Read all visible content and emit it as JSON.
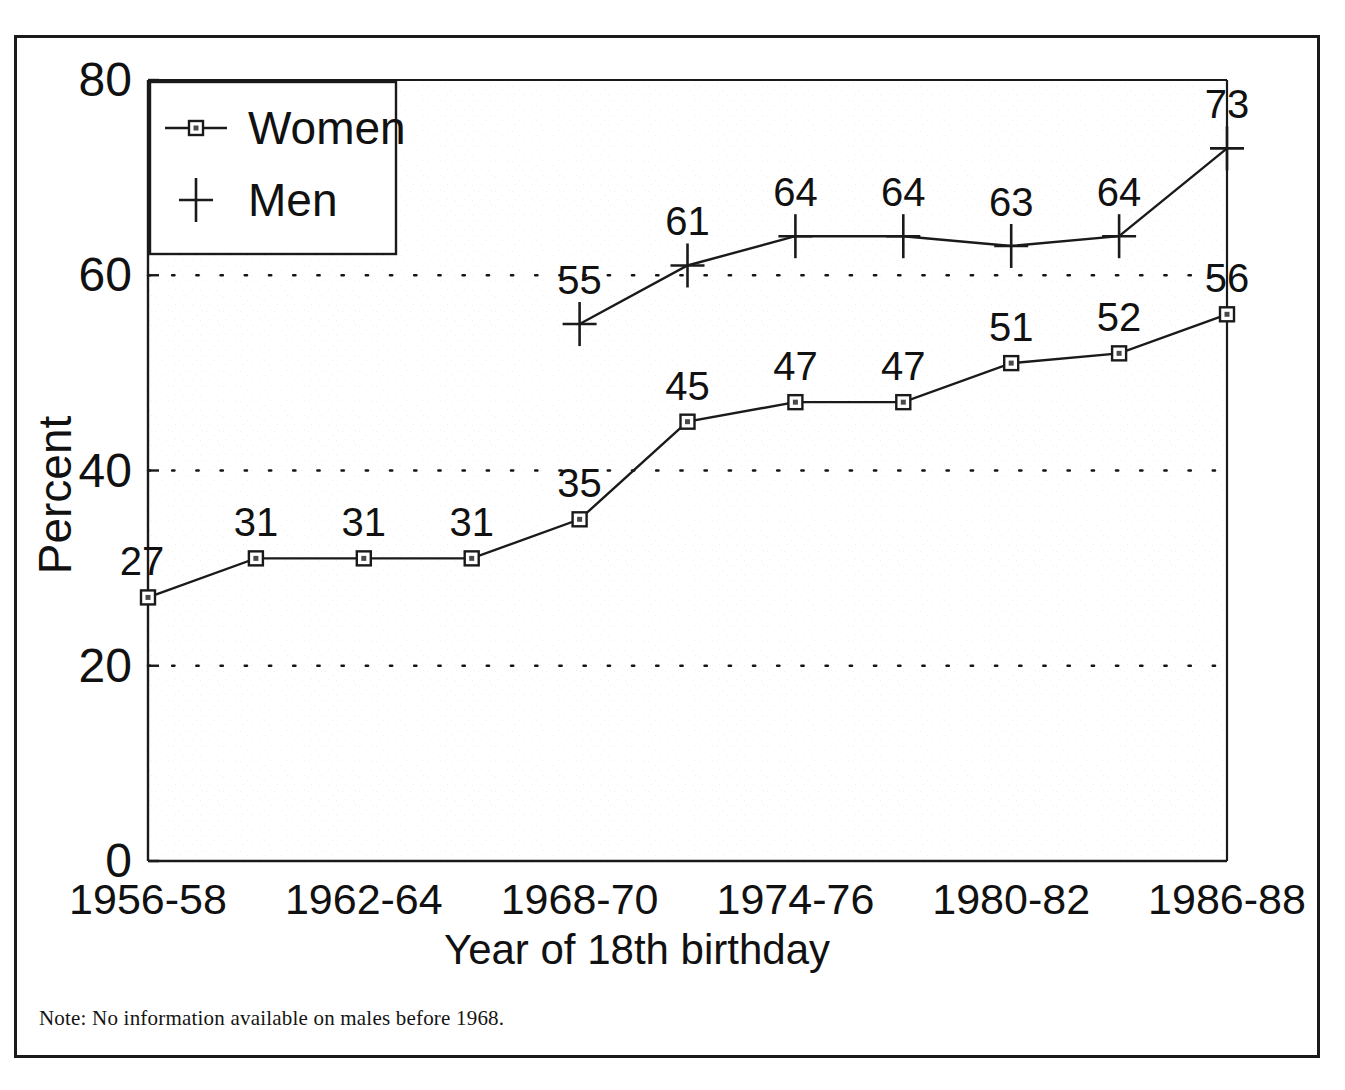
{
  "figure": {
    "note": "Note: No information available on males before 1968."
  },
  "chart_data": {
    "type": "line",
    "title": "",
    "xlabel": "Year of 18th birthday",
    "ylabel": "Percent",
    "ylim": [
      0,
      80
    ],
    "yticks": [
      "0",
      "20",
      "40",
      "60",
      "80"
    ],
    "ytick_values": [
      0,
      20,
      40,
      60,
      80
    ],
    "grid": "horizontal-dotted",
    "gridlines_at": [
      20,
      40,
      60
    ],
    "legend_position": "top-left",
    "xtick_labels": [
      "1956-58",
      "1962-64",
      "1968-70",
      "1974-76",
      "1980-82",
      "1986-88"
    ],
    "xtick_index": [
      0,
      2,
      4,
      6,
      8,
      10
    ],
    "x": [
      "1956-58",
      "1959-61",
      "1962-64",
      "1965-67",
      "1968-70",
      "1971-73",
      "1974-76",
      "1977-79",
      "1980-82",
      "1983-85",
      "1986-88"
    ],
    "series": [
      {
        "name": "Women",
        "marker": "square",
        "values": [
          27,
          31,
          31,
          31,
          35,
          45,
          47,
          47,
          51,
          52,
          56
        ],
        "labels": [
          "27",
          "31",
          "31",
          "31",
          "35",
          "45",
          "47",
          "47",
          "51",
          "52",
          "56"
        ]
      },
      {
        "name": "Men",
        "marker": "plus",
        "values": [
          null,
          null,
          null,
          null,
          55,
          61,
          64,
          64,
          63,
          64,
          73
        ],
        "labels": [
          "",
          "",
          "",
          "",
          "55",
          "61",
          "64",
          "64",
          "63",
          "64",
          "73"
        ]
      }
    ]
  }
}
